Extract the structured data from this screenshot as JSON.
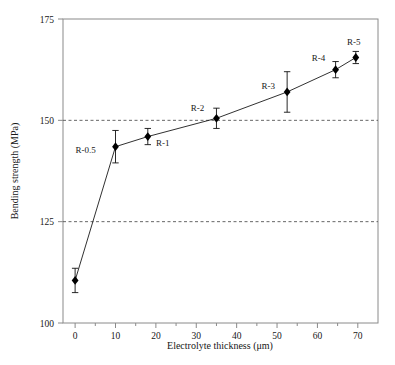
{
  "chart_data": {
    "type": "scatter",
    "title": "",
    "xlabel": "Electrolyte thickness (μm)",
    "ylabel": "Bending strength (MPa)",
    "xlim": [
      -3,
      75
    ],
    "ylim": [
      100,
      175
    ],
    "xticks": [
      0,
      10,
      20,
      30,
      40,
      50,
      60,
      70
    ],
    "xtick_labels": [
      "0",
      "10",
      "20",
      "30",
      "40",
      "50",
      "60",
      "70"
    ],
    "yticks": [
      100,
      125,
      150,
      175
    ],
    "ytick_labels": [
      "100",
      "125",
      "150",
      "175"
    ],
    "xminor_step": 5,
    "grid": "horizontal dashed at 125 and 150",
    "gridlines_y": [
      125,
      150
    ],
    "legend": "none",
    "marker": "filled diamond",
    "line": "solid thin black connecting points",
    "errorbars": "vertical, symmetric, with caps",
    "x": [
      0,
      10,
      18,
      35,
      52.5,
      64.5,
      69.5
    ],
    "values": [
      110.5,
      143.5,
      146,
      150.5,
      157,
      162.5,
      165.5
    ],
    "yerr": [
      3,
      4,
      2,
      2.5,
      5,
      2,
      1.5
    ],
    "point_labels": [
      "",
      "R-0.5",
      "R-1",
      "R-2",
      "R-3",
      "R-4",
      "R-5"
    ],
    "series": [
      {
        "name": "Bending strength",
        "points": [
          {
            "label": "",
            "x": 0,
            "y": 110.5,
            "err": 3.0,
            "label_dx": 0,
            "label_dy": 0
          },
          {
            "label": "R-0.5",
            "x": 10,
            "y": 143.5,
            "err": 4.0,
            "label_dx": -30,
            "label_dy": 6
          },
          {
            "label": "R-1",
            "x": 18,
            "y": 146.0,
            "err": 2.0,
            "label_dx": 15,
            "label_dy": 9
          },
          {
            "label": "R-2",
            "x": 35,
            "y": 150.5,
            "err": 2.5,
            "label_dx": -19,
            "label_dy": -7
          },
          {
            "label": "R-3",
            "x": 52.5,
            "y": 157.0,
            "err": 5.0,
            "label_dx": -19,
            "label_dy": -3
          },
          {
            "label": "R-4",
            "x": 64.5,
            "y": 162.5,
            "err": 2.0,
            "label_dx": -17,
            "label_dy": -9
          },
          {
            "label": "R-5",
            "x": 69.5,
            "y": 165.5,
            "err": 1.5,
            "label_dx": -2,
            "label_dy": -13
          }
        ]
      }
    ]
  },
  "axes": {
    "x_title": "Electrolyte thickness (μm)",
    "y_title": "Bending strength (MPa)",
    "x_tick_labels": [
      "0",
      "10",
      "20",
      "30",
      "40",
      "50",
      "60",
      "70"
    ],
    "y_tick_labels": [
      "100",
      "125",
      "150",
      "175"
    ]
  },
  "colors": {
    "line": "#1a1a1a",
    "marker": "#000000",
    "frame": "#8a8a8a",
    "grid": "#555555",
    "text": "#171717",
    "background": "#ffffff"
  }
}
